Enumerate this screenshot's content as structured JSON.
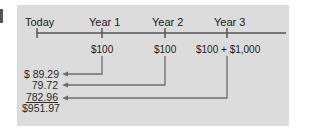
{
  "timeline": {
    "points": [
      {
        "label": "Today",
        "cash_flow": ""
      },
      {
        "label": "Year 1",
        "cash_flow": "$100"
      },
      {
        "label": "Year 2",
        "cash_flow": "$100"
      },
      {
        "label": "Year 3",
        "cash_flow": "$100 + $1,000"
      }
    ]
  },
  "present_values": [
    {
      "text": "$  89.29",
      "underlined": false
    },
    {
      "text": "79.72",
      "underlined": false
    },
    {
      "text": "782.96",
      "underlined": true
    }
  ],
  "total": {
    "text": "$951.97"
  },
  "colors": {
    "panel": "#dcdcdc",
    "line": "#555555",
    "arrow": "#6e6e6e",
    "text": "#1a1a1a"
  }
}
